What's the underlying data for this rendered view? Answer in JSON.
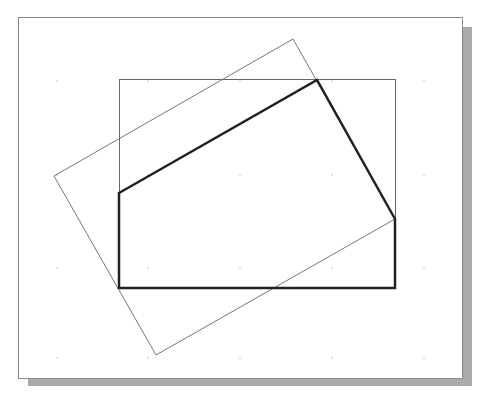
{
  "diagram": {
    "canvas": {
      "width": 484,
      "height": 397,
      "background": "#ffffff"
    },
    "frame": {
      "x": 18,
      "y": 17,
      "width": 444,
      "height": 361,
      "stroke": "#8a8a8a",
      "shadow": "#aaaaaa",
      "shadow_offset": 10
    },
    "grid": {
      "color": "#bbbbbb",
      "xs": [
        57,
        148,
        240,
        332,
        424
      ],
      "ys": [
        81,
        175,
        268,
        358
      ]
    },
    "clip_rect": {
      "x": 119,
      "y": 79,
      "width": 276,
      "height": 209,
      "stroke": "#666666",
      "stroke_width": 1
    },
    "rotated_rect": {
      "points": [
        [
          293,
          39
        ],
        [
          395,
          219
        ],
        [
          156,
          355
        ],
        [
          54,
          176
        ]
      ],
      "stroke": "#777777",
      "stroke_width": 1
    },
    "clipped_polygon": {
      "points": [
        [
          119,
          193
        ],
        [
          317,
          80
        ],
        [
          395,
          219
        ],
        [
          395,
          288
        ],
        [
          119,
          288
        ]
      ],
      "stroke": "#222222",
      "stroke_width": 2.5
    }
  }
}
